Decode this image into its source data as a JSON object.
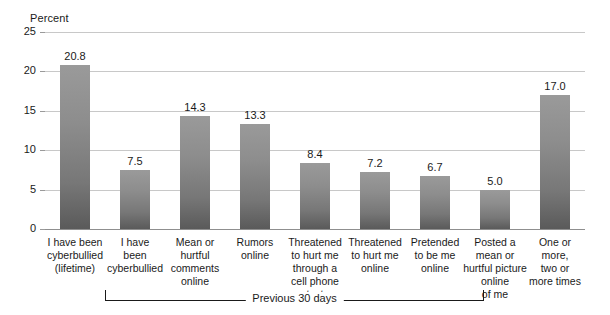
{
  "chart_data": {
    "type": "bar",
    "title": "",
    "xlabel": "",
    "ylabel": "Percent",
    "ylim": [
      0,
      25
    ],
    "ytick_labels": [
      "0",
      "5",
      "10",
      "15",
      "20",
      "25"
    ],
    "ytick_values": [
      0,
      5,
      10,
      15,
      20,
      25
    ],
    "grid": true,
    "legend": "none",
    "categories": [
      "I have been\ncyberbullied\n(lifetime)",
      "I have\nbeen\ncyberbullied",
      "Mean or\nhurtful\ncomments\nonline",
      "Rumors\nonline",
      "Threatened\nto hurt me\nthrough a\ncell phone text",
      "Threatened\nto hurt me\nonline",
      "Pretended\nto be me\nonline",
      "Posted a\nmean or\nhurtful picture\nonline\nof me",
      "One or\nmore,\ntwo or\nmore times"
    ],
    "values": [
      20.8,
      7.5,
      14.3,
      13.3,
      8.4,
      7.2,
      6.7,
      5.0,
      17.0
    ],
    "value_labels": [
      "20.8",
      "7.5",
      "14.3",
      "13.3",
      "8.4",
      "7.2",
      "6.7",
      "5.0",
      "17.0"
    ],
    "annotations": [
      {
        "name": "previous-30-days-bracket",
        "text": "Previous 30 days",
        "spans_categories": [
          1,
          7
        ]
      }
    ],
    "colors": {
      "bar_top": "#9a9a9a",
      "bar_bottom": "#5a5a5a",
      "gridline": "#c8c8c8",
      "axis": "#8f8f8f",
      "text": "#1a1a1a",
      "background": "#ffffff"
    }
  }
}
